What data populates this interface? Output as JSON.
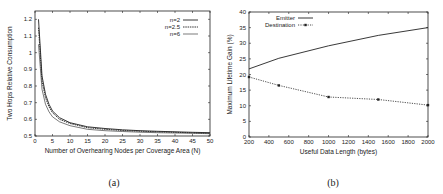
{
  "chart_data": [
    {
      "type": "line",
      "caption": "(a)",
      "title": "",
      "xlabel": "Number of Overhearing Nodes per Coverage Area (N)",
      "ylabel": "Two Hops Relative Consumption",
      "xlim": [
        0,
        50
      ],
      "ylim": [
        0.5,
        1.25
      ],
      "xticks": [
        0,
        5,
        10,
        15,
        20,
        25,
        30,
        35,
        40,
        45,
        50
      ],
      "yticks": [
        0.5,
        0.6,
        0.7,
        0.8,
        0.9,
        1,
        1.1,
        1.2
      ],
      "grid": false,
      "legend_position": "top-right",
      "x": [
        1,
        2,
        3,
        4,
        5,
        7,
        10,
        15,
        20,
        25,
        30,
        35,
        40,
        45,
        50
      ],
      "series": [
        {
          "name": "n=2",
          "values": [
            1.2,
            0.86,
            0.75,
            0.69,
            0.65,
            0.61,
            0.58,
            0.555,
            0.545,
            0.537,
            0.532,
            0.528,
            0.525,
            0.522,
            0.52
          ]
        },
        {
          "name": "n=2.5",
          "values": [
            1.15,
            0.83,
            0.73,
            0.675,
            0.64,
            0.6,
            0.575,
            0.55,
            0.54,
            0.533,
            0.529,
            0.525,
            0.522,
            0.519,
            0.517
          ]
        },
        {
          "name": "n=6",
          "values": [
            1.05,
            0.78,
            0.69,
            0.645,
            0.615,
            0.585,
            0.562,
            0.54,
            0.532,
            0.527,
            0.523,
            0.52,
            0.518,
            0.516,
            0.514
          ]
        }
      ]
    },
    {
      "type": "line",
      "caption": "(b)",
      "title": "",
      "xlabel": "Useful Data Length (bytes)",
      "ylabel": "Maximum Lifetime Gain (%)",
      "xlim": [
        200,
        2000
      ],
      "ylim": [
        0,
        40
      ],
      "xticks": [
        200,
        400,
        600,
        800,
        1000,
        1200,
        1400,
        1600,
        1800,
        2000
      ],
      "yticks": [
        0,
        5,
        10,
        15,
        20,
        25,
        30,
        35,
        40
      ],
      "grid": false,
      "legend_position": "top-left",
      "x": [
        200,
        500,
        1000,
        1500,
        2000
      ],
      "series": [
        {
          "name": "Emitter",
          "values": [
            21.8,
            25.2,
            29.2,
            32.5,
            35.0
          ]
        },
        {
          "name": "Destination",
          "values": [
            19.2,
            16.5,
            12.8,
            12.0,
            10.2
          ]
        }
      ]
    }
  ]
}
